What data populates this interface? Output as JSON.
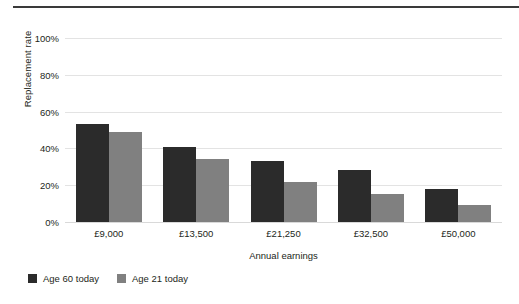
{
  "chart_data": {
    "type": "bar",
    "title": "",
    "xlabel": "Annual earnings",
    "ylabel": "Replacement rate",
    "categories": [
      "£9,000",
      "£13,500",
      "£21,250",
      "£32,500",
      "£50,000"
    ],
    "series": [
      {
        "name": "Age 60 today",
        "color": "#2b2b2b",
        "values": [
          53,
          41,
          33,
          28,
          18
        ]
      },
      {
        "name": "Age 21 today",
        "color": "#808080",
        "values": [
          49,
          34,
          22,
          15,
          9
        ]
      }
    ],
    "ylim": [
      0,
      100
    ],
    "yticks": [
      "0%",
      "20%",
      "40%",
      "60%",
      "80%",
      "100%"
    ],
    "ytick_values": [
      0,
      20,
      40,
      60,
      80,
      100
    ],
    "grid": "horizontal",
    "legend_position": "bottom-left",
    "axis_value_suffix": "%"
  },
  "legend": {
    "entries": [
      {
        "label": "Age 60 today",
        "color": "#2b2b2b"
      },
      {
        "label": "Age 21 today",
        "color": "#808080"
      }
    ]
  }
}
